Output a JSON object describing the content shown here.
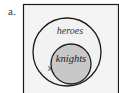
{
  "figure": {
    "label": "a.",
    "sets": {
      "outer": {
        "name": "heroes",
        "fill": "#f2f2f2"
      },
      "inner": {
        "name": "knights",
        "fill": "#c8c8c8"
      }
    },
    "marker": {
      "symbol": "x"
    },
    "colors": {
      "stroke": "#1a1a1a",
      "box_fill": "#f4f4f4"
    }
  }
}
